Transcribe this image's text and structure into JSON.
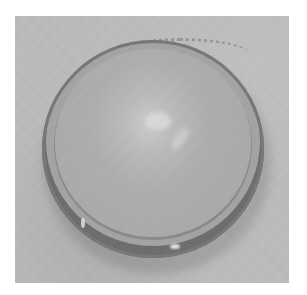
{
  "image": {
    "description": "Grayscale photograph of a round dish with a scalloped rim on a textured light gray background",
    "subject": "round-dish",
    "palette": {
      "background": "#bdbdbd",
      "dish_fill": "#acacac",
      "rim": "#6c6c6c",
      "highlight": "#e6e6e6",
      "page": "#ffffff"
    }
  }
}
